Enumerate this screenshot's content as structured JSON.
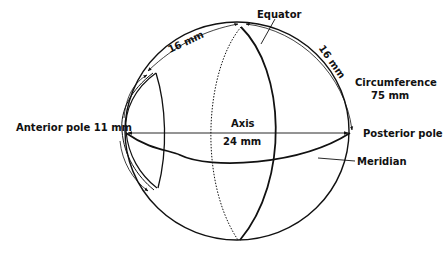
{
  "diagram": {
    "labels": {
      "equator": "Equator",
      "arc_top_left": "16 mm",
      "arc_top_right": "16 mm",
      "circumference_title": "Circumference",
      "circumference_value": "75 mm",
      "anterior_pole": "Anterior pole 11 mm",
      "axis_title": "Axis",
      "axis_value": "24 mm",
      "posterior_pole": "Posterior pole",
      "meridian": "Meridian"
    },
    "colors": {
      "line": "#111111",
      "background": "#ffffff"
    }
  }
}
